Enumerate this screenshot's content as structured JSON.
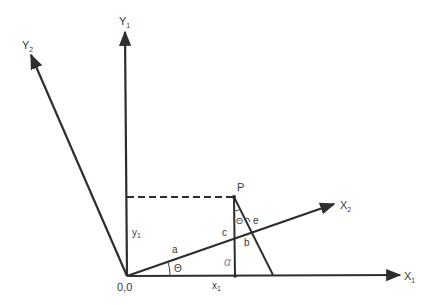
{
  "diagram": {
    "type": "coordinate-rotation",
    "axes": {
      "y1": {
        "label": "Y",
        "sub": "1"
      },
      "y2": {
        "label": "Y",
        "sub": "2"
      },
      "x1": {
        "label": "X",
        "sub": "1"
      },
      "x2": {
        "label": "X",
        "sub": "2"
      }
    },
    "point": {
      "label": "P"
    },
    "origin_label": "0,0",
    "segment_labels": {
      "a": "a",
      "b": "b",
      "c": "c",
      "e": "e",
      "y1": {
        "label": "y",
        "sub": "1"
      },
      "x1": {
        "label": "x",
        "sub": "1"
      }
    },
    "angle_labels": {
      "theta_origin": "Θ",
      "theta_p": "Θ",
      "alpha": "α"
    }
  }
}
